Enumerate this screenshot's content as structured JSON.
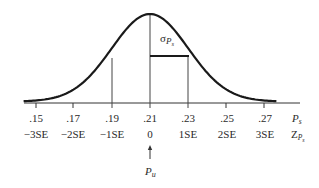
{
  "chart_data": {
    "type": "line",
    "title": "",
    "mean": 0.21,
    "standard_error": 0.02,
    "x_ticks": [
      ".15",
      ".17",
      ".19",
      ".21",
      ".23",
      ".25",
      ".27"
    ],
    "x_tick_values": [
      0.15,
      0.17,
      0.19,
      0.21,
      0.23,
      0.25,
      0.27
    ],
    "z_ticks": [
      "−3SE",
      "−2SE",
      "−1SE",
      "0",
      "1SE",
      "2SE",
      "3SE"
    ],
    "row1_axis_label": "P",
    "row1_axis_label_sub": "s",
    "row2_axis_label": "Z",
    "row2_axis_label_sub": "P",
    "row2_axis_label_subsub": "s",
    "sigma_label": "σ",
    "sigma_label_sub": "P",
    "sigma_label_subsub": "s",
    "vertical_lines_at": [
      0.19,
      0.21,
      0.23
    ],
    "arrow_label": "P",
    "arrow_label_sub": "u",
    "arrow_points_to": 0.21,
    "grid": false,
    "legend": "none"
  },
  "diagram": {
    "curve_color": "#1a1a1a",
    "axis_color": "#333333"
  }
}
